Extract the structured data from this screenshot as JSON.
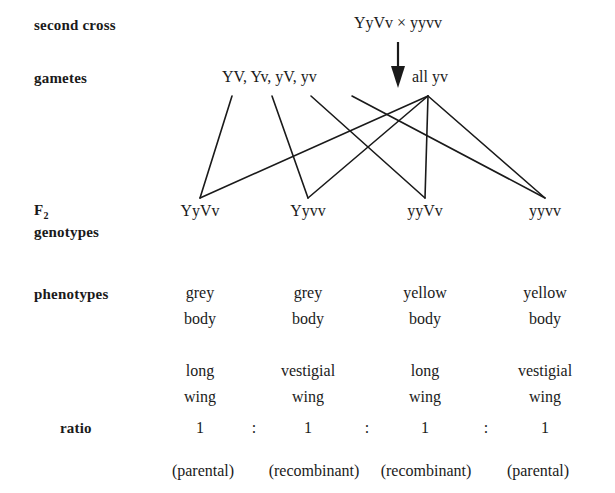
{
  "diagram": {
    "background_color": "#ffffff",
    "ink_color": "#1a1a1a"
  },
  "rows": {
    "second_cross": {
      "label": "second cross",
      "value": "YyVv × yyvv"
    },
    "gametes": {
      "label": "gametes",
      "left_value": "YV, Yv, yV, yv",
      "right_value": "all yv"
    },
    "f2_genotypes": {
      "label_line1": "F",
      "label_sub": "2",
      "label_line2": "genotypes",
      "values": [
        "YyVv",
        "Yyvv",
        "yyVv",
        "yyvv"
      ]
    },
    "phenotypes": {
      "label": "phenotypes",
      "body_color": [
        "grey",
        "grey",
        "yellow",
        "yellow"
      ],
      "body_word": [
        "body",
        "body",
        "body",
        "body"
      ],
      "wing_type": [
        "long",
        "vestigial",
        "long",
        "vestigial"
      ],
      "wing_word": [
        "wing",
        "wing",
        "wing",
        "wing"
      ]
    },
    "ratio": {
      "label": "ratio",
      "values": [
        "1",
        "1",
        "1",
        "1"
      ],
      "separators": [
        ":",
        ":",
        ":"
      ]
    },
    "classification": {
      "values": [
        "(parental)",
        "(recombinant)",
        "(recombinant)",
        "(parental)"
      ]
    }
  },
  "arrow": {
    "name": "downward-cross-arrow"
  }
}
